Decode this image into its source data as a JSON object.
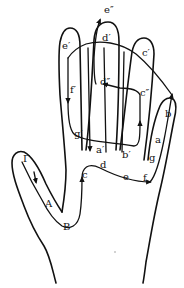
{
  "diagram": {
    "colors": {
      "ink": "#111111",
      "background": "#ffffff"
    },
    "labels": {
      "e_double": "e″",
      "d_prime": "d′",
      "e_prime": "e′",
      "c_prime": "c′",
      "f_prime": "f′",
      "d_double": "d″",
      "c_double": "c″",
      "b": "b",
      "a": "a",
      "g_prime": "g′",
      "a_prime": "a′",
      "b_prime": "b′",
      "g": "g",
      "c": "c",
      "d": "d",
      "e": "e",
      "f": "f",
      "gamma": "Γ",
      "A": "A",
      "B": "B"
    }
  }
}
